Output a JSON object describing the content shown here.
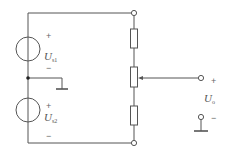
{
  "diagram": {
    "type": "circuit",
    "colors": {
      "wire": "#555555",
      "background": "#ffffff",
      "text": "#555555"
    },
    "sources": [
      {
        "id": "source-1",
        "symbol": "U",
        "subscript": "s1",
        "plus": "+",
        "minus": "−"
      },
      {
        "id": "source-2",
        "symbol": "U",
        "subscript": "s2",
        "plus": "+",
        "minus": "−"
      }
    ],
    "output": {
      "symbol": "U",
      "subscript": "o",
      "plus": "+",
      "minus": "−"
    },
    "components": [
      {
        "id": "resistor-top",
        "kind": "resistor"
      },
      {
        "id": "potentiometer",
        "kind": "potentiometer"
      },
      {
        "id": "resistor-bottom",
        "kind": "resistor"
      }
    ],
    "grounds": [
      "midpoint-ground",
      "output-ground"
    ]
  }
}
